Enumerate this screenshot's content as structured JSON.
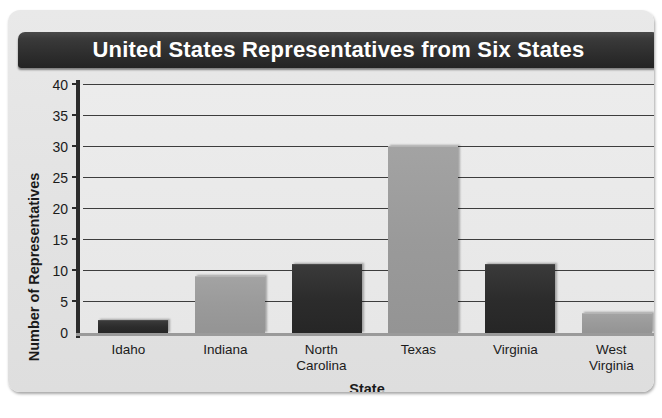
{
  "chart_data": {
    "type": "bar",
    "title": "United States Representatives from Six States",
    "xlabel": "State",
    "ylabel": "Number of Representatives",
    "categories": [
      "Idaho",
      "Indiana",
      "North Carolina",
      "Texas",
      "Virginia",
      "West Virginia"
    ],
    "values": [
      2,
      9,
      11,
      30,
      11,
      3
    ],
    "ylim": [
      0,
      40
    ],
    "ytick_labels": [
      "0",
      "5",
      "10",
      "15",
      "20",
      "25",
      "30",
      "35",
      "40"
    ],
    "ytick_values": [
      0,
      5,
      10,
      15,
      20,
      25,
      30,
      35,
      40
    ],
    "grid": true,
    "legend": "none",
    "bar_colors": [
      "#2c2c2c",
      "#9a9a9a",
      "#2c2c2c",
      "#9a9a9a",
      "#2c2c2c",
      "#9a9a9a"
    ],
    "colors": {
      "bar_dark": "#2c2c2c",
      "bar_light": "#9a9a9a",
      "title_bar": "#2e2e2e",
      "title_text": "#ffffff",
      "panel_background": "#e4e4e4",
      "plot_background": "#ececec",
      "gridline": "#3d3d3d",
      "axis": "#2b2b2b"
    }
  }
}
